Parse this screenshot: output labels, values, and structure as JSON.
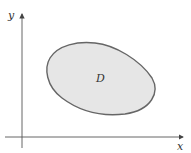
{
  "diagram": {
    "axes": {
      "x_label": "x",
      "y_label": "y"
    },
    "region": {
      "label": "D",
      "fill": "#e6e6e6",
      "stroke": "#666666"
    }
  }
}
